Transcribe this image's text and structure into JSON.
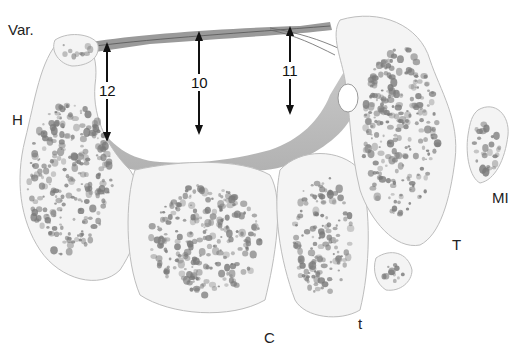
{
  "figure": {
    "labels": {
      "var": "Var.",
      "h": "H",
      "c": "C",
      "t_small": "t",
      "t_capital": "T",
      "mi": "MI"
    },
    "measurements": [
      "12",
      "10",
      "11"
    ],
    "colors": {
      "bone_fill": "#f4f4f4",
      "bone_edge": "#bdbdbd",
      "trabecula": "#7a7a7a",
      "ligament": "#a9a9a9",
      "arrow": "#111111"
    }
  }
}
